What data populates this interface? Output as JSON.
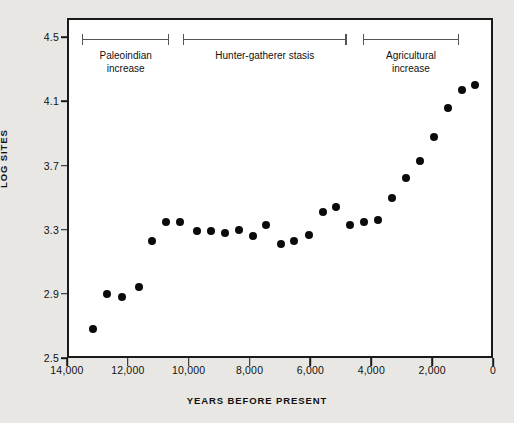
{
  "chart_data": {
    "type": "scatter",
    "title": "",
    "xlabel": "YEARS BEFORE PRESENT",
    "ylabel": "LOG SITES",
    "xlim": [
      14000,
      0
    ],
    "ylim": [
      2.5,
      4.62
    ],
    "x_reversed": true,
    "grid": false,
    "legend": null,
    "xticks": [
      14000,
      12000,
      10000,
      8000,
      6000,
      4000,
      2000,
      0
    ],
    "xticklabels": [
      "14,000",
      "12,000",
      "10,000",
      "8,000",
      "6,000",
      "4,000",
      "2,000",
      "0"
    ],
    "yticks": [
      2.5,
      2.9,
      3.3,
      3.7,
      4.1,
      4.5
    ],
    "yticklabels": [
      "2.5",
      "2.9",
      "3.3",
      "3.7",
      "4.1",
      "4.5"
    ],
    "marker": "filled-circle",
    "marker_color": "#0b0b0b",
    "points": [
      {
        "x": 13150,
        "y": 2.68
      },
      {
        "x": 12700,
        "y": 2.9
      },
      {
        "x": 12180,
        "y": 2.88
      },
      {
        "x": 11620,
        "y": 2.94
      },
      {
        "x": 11220,
        "y": 3.23
      },
      {
        "x": 10740,
        "y": 3.35
      },
      {
        "x": 10280,
        "y": 3.35
      },
      {
        "x": 9730,
        "y": 3.29
      },
      {
        "x": 9280,
        "y": 3.29
      },
      {
        "x": 8820,
        "y": 3.28
      },
      {
        "x": 8350,
        "y": 3.3
      },
      {
        "x": 7900,
        "y": 3.26
      },
      {
        "x": 7450,
        "y": 3.33
      },
      {
        "x": 6980,
        "y": 3.21
      },
      {
        "x": 6530,
        "y": 3.23
      },
      {
        "x": 6060,
        "y": 3.27
      },
      {
        "x": 5600,
        "y": 3.41
      },
      {
        "x": 5150,
        "y": 3.44
      },
      {
        "x": 4700,
        "y": 3.33
      },
      {
        "x": 4230,
        "y": 3.35
      },
      {
        "x": 3780,
        "y": 3.36
      },
      {
        "x": 3320,
        "y": 3.5
      },
      {
        "x": 2860,
        "y": 3.62
      },
      {
        "x": 2400,
        "y": 3.73
      },
      {
        "x": 1940,
        "y": 3.88
      },
      {
        "x": 1490,
        "y": 4.06
      },
      {
        "x": 1030,
        "y": 4.17
      },
      {
        "x": 580,
        "y": 4.2
      }
    ],
    "annotations": [
      {
        "label": "Paleoindian\nincrease",
        "line1": "Paleoindian",
        "line2": "increase",
        "x_start": 13500,
        "x_end": 10640
      },
      {
        "label": "Hunter-gatherer stasis",
        "line1": "Hunter-gatherer stasis",
        "line2": "",
        "x_start": 10190,
        "x_end": 4810
      },
      {
        "label": "Agricultural\nincrease",
        "line1": "Agricultural",
        "line2": "increase",
        "x_start": 4270,
        "x_end": 1120
      }
    ]
  },
  "colors": {
    "page_background": "#e8e7e3",
    "plot_background": "#ffffff",
    "frame": "#1a1a1a",
    "marker": "#0b0b0b",
    "bracket": "#555555",
    "text": "#111111"
  }
}
